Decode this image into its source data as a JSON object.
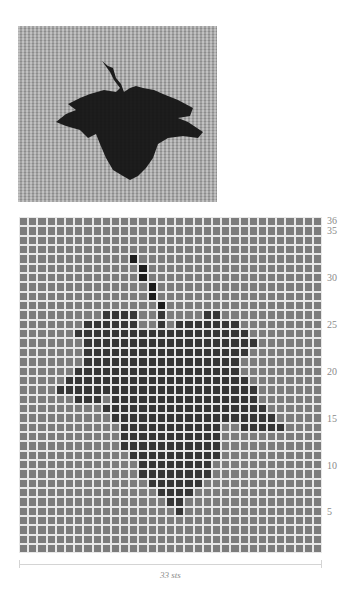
{
  "photo": {
    "description": "Knitted swatch photo showing a dark leaf motif on a light grey stockinette background",
    "background_color": "#a9a9a9",
    "motif_color": "#141414"
  },
  "chart_data": {
    "type": "heatmap",
    "title": "",
    "columns": 33,
    "rows": 36,
    "xlabel": "33 sts",
    "ylabel": "",
    "row_tick_labels": [
      "36",
      "35",
      "30",
      "25",
      "20",
      "15",
      "10",
      "5"
    ],
    "row_tick_values": [
      36,
      35,
      30,
      25,
      20,
      15,
      10,
      5
    ],
    "colors": {
      "background": "#7c7c7c",
      "leaf": "#363636",
      "stem": "#1c1c1c",
      "gridline": "#e8e8e8"
    },
    "stem_cells": [
      {
        "row": 32,
        "cols": [
          13
        ]
      },
      {
        "row": 31,
        "cols": [
          14
        ]
      },
      {
        "row": 30,
        "cols": [
          14
        ]
      },
      {
        "row": 29,
        "cols": [
          15
        ]
      },
      {
        "row": 28,
        "cols": [
          15
        ]
      },
      {
        "row": 27,
        "cols": [
          16
        ]
      }
    ],
    "leaf_rows": [
      {
        "row": 26,
        "ranges": [
          [
            10,
            13
          ],
          [
            16,
            16
          ],
          [
            21,
            22
          ]
        ]
      },
      {
        "row": 25,
        "ranges": [
          [
            8,
            13
          ],
          [
            16,
            16
          ],
          [
            18,
            24
          ]
        ]
      },
      {
        "row": 24,
        "ranges": [
          [
            7,
            25
          ]
        ]
      },
      {
        "row": 23,
        "ranges": [
          [
            8,
            26
          ]
        ]
      },
      {
        "row": 22,
        "ranges": [
          [
            8,
            25
          ]
        ]
      },
      {
        "row": 21,
        "ranges": [
          [
            8,
            24
          ]
        ]
      },
      {
        "row": 20,
        "ranges": [
          [
            7,
            24
          ]
        ]
      },
      {
        "row": 19,
        "ranges": [
          [
            6,
            25
          ]
        ]
      },
      {
        "row": 18,
        "ranges": [
          [
            5,
            26
          ]
        ]
      },
      {
        "row": 17,
        "ranges": [
          [
            7,
            9
          ],
          [
            11,
            26
          ]
        ]
      },
      {
        "row": 16,
        "ranges": [
          [
            10,
            27
          ]
        ]
      },
      {
        "row": 15,
        "ranges": [
          [
            11,
            28
          ]
        ]
      },
      {
        "row": 14,
        "ranges": [
          [
            12,
            22
          ],
          [
            25,
            29
          ]
        ]
      },
      {
        "row": 13,
        "ranges": [
          [
            12,
            22
          ]
        ]
      },
      {
        "row": 12,
        "ranges": [
          [
            12,
            22
          ]
        ]
      },
      {
        "row": 11,
        "ranges": [
          [
            13,
            22
          ]
        ]
      },
      {
        "row": 10,
        "ranges": [
          [
            14,
            21
          ]
        ]
      },
      {
        "row": 9,
        "ranges": [
          [
            14,
            21
          ]
        ]
      },
      {
        "row": 8,
        "ranges": [
          [
            15,
            20
          ]
        ]
      },
      {
        "row": 7,
        "ranges": [
          [
            16,
            19
          ]
        ]
      },
      {
        "row": 6,
        "ranges": [
          [
            17,
            18
          ]
        ]
      },
      {
        "row": 5,
        "ranges": [
          [
            18,
            18
          ]
        ]
      }
    ]
  },
  "footer": {
    "width_label": "33 sts"
  }
}
